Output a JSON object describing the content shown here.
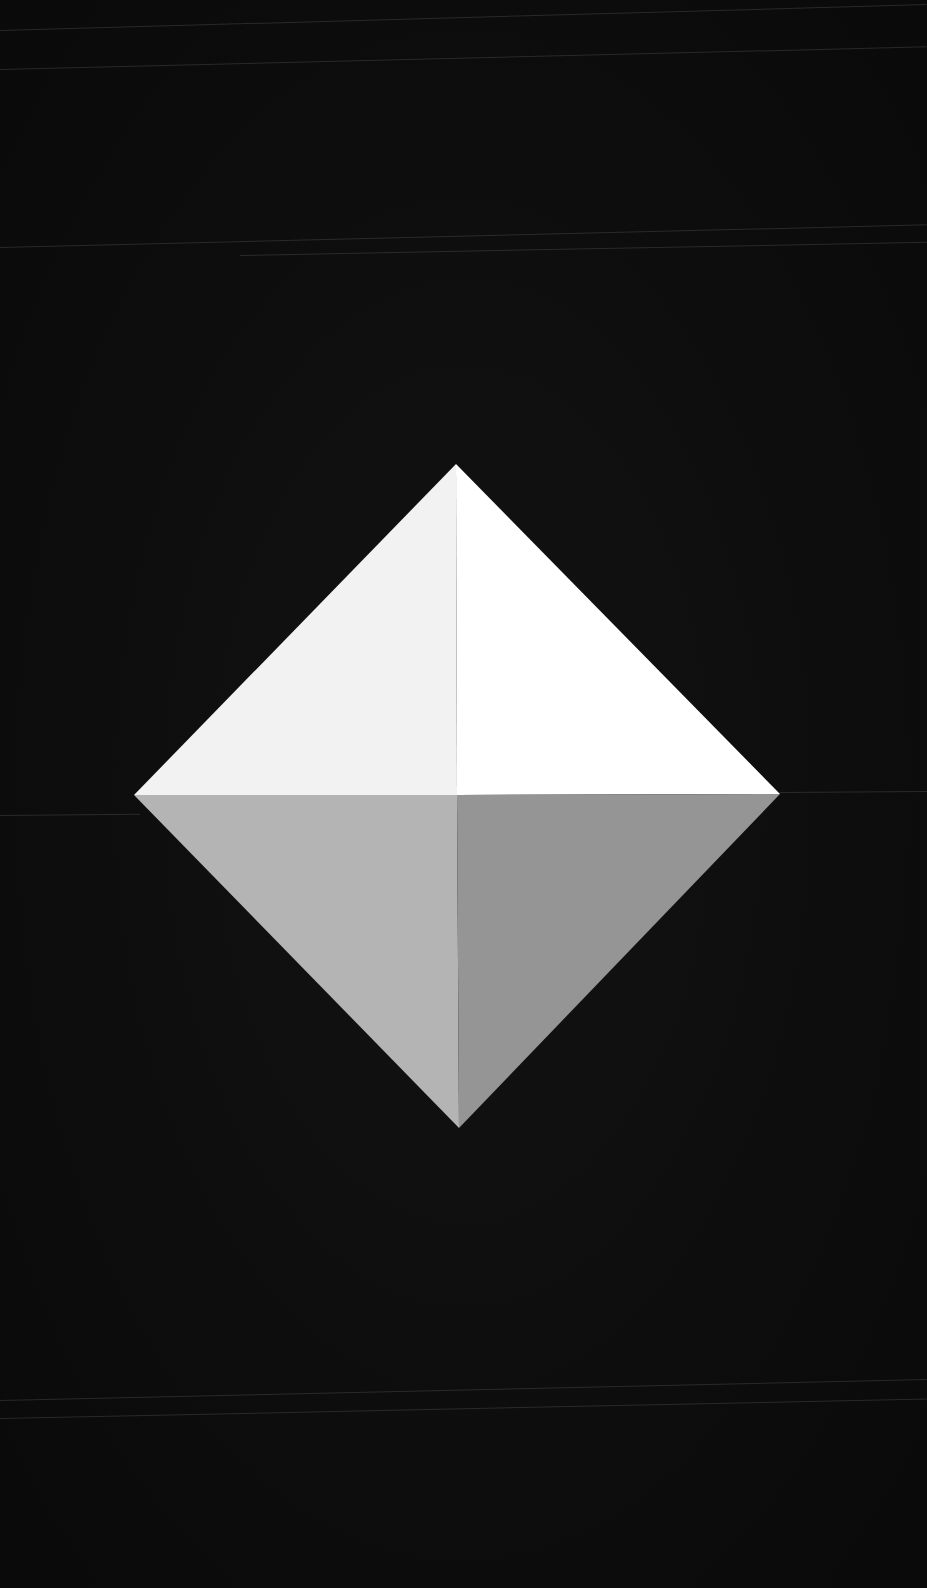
{
  "artwork": {
    "subject": "diamond-octahedron",
    "background_color": "#0d0d0d",
    "vertices": {
      "top": [
        456,
        464
      ],
      "left": [
        134,
        795
      ],
      "right": [
        780,
        794
      ],
      "bottom": [
        459,
        1128
      ],
      "center": [
        457,
        795
      ]
    },
    "faces": {
      "top_left": "#f2f2f2",
      "top_right": "#ffffff",
      "bottom_left": "#b4b4b4",
      "bottom_right": "#959595"
    }
  },
  "scanlines": [
    {
      "x": 0,
      "y": 69,
      "w": 927,
      "angle": -1.4
    },
    {
      "x": 0,
      "y": 30,
      "w": 927,
      "angle": -1.6
    },
    {
      "x": 0,
      "y": 247,
      "w": 927,
      "angle": -1.4
    },
    {
      "x": 240,
      "y": 255,
      "w": 687,
      "angle": -1.1
    },
    {
      "x": 0,
      "y": 815,
      "w": 140,
      "angle": -0.5
    },
    {
      "x": 780,
      "y": 792,
      "w": 147,
      "angle": -0.4
    },
    {
      "x": 0,
      "y": 1400,
      "w": 927,
      "angle": -1.3
    },
    {
      "x": 0,
      "y": 1418,
      "w": 927,
      "angle": -1.2
    }
  ]
}
